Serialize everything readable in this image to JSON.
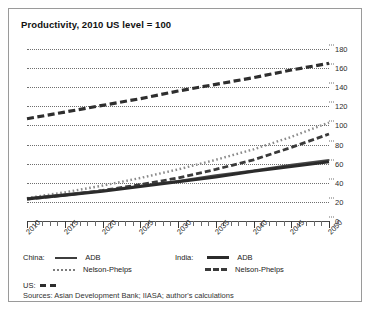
{
  "figure": {
    "title": "Productivity, 2010 US level = 100",
    "sources": "Sources: Asian Development Bank; IIASA; author's calculations"
  },
  "legend": {
    "china_label": "China:",
    "india_label": "India:",
    "us_label": "US:",
    "adb_label": "ADB",
    "nelson_phelps_label": "Nelson-Phelps"
  },
  "chart_data": {
    "type": "line",
    "title": "Productivity, 2010 US level = 100",
    "xlabel": "",
    "ylabel": "",
    "xlim": [
      2010,
      2050
    ],
    "ylim": [
      0,
      180
    ],
    "ytick_values": [
      0,
      20,
      40,
      60,
      80,
      100,
      120,
      140,
      160,
      180
    ],
    "xtick_labels": [
      "2010",
      "2015",
      "2020",
      "2025",
      "2030",
      "2035",
      "2040",
      "2045",
      "2050"
    ],
    "xtick_values": [
      2010,
      2015,
      2020,
      2025,
      2030,
      2035,
      2040,
      2045,
      2050
    ],
    "grid": "horizontal-dotted",
    "legend_position": "below-plot",
    "x": [
      2010,
      2015,
      2020,
      2025,
      2030,
      2035,
      2040,
      2045,
      2050
    ],
    "series": [
      {
        "name": "US",
        "style": "dashed-thick",
        "color": "#2e2e2e",
        "values": [
          107,
          114,
          121,
          128,
          136,
          143,
          150,
          158,
          165
        ]
      },
      {
        "name": "China: Nelson-Phelps",
        "style": "dotted",
        "color": "#8a8a8a",
        "values": [
          24,
          30,
          37,
          45,
          54,
          64,
          75,
          88,
          103
        ]
      },
      {
        "name": "India: Nelson-Phelps",
        "style": "dashed",
        "color": "#3a3a3a",
        "values": [
          23,
          27,
          32,
          38,
          45,
          54,
          64,
          77,
          91
        ]
      },
      {
        "name": "China: ADB",
        "style": "solid-thin",
        "color": "#4a4a4a",
        "values": [
          24,
          28,
          32,
          37,
          42,
          48,
          53,
          59,
          64
        ]
      },
      {
        "name": "India: ADB",
        "style": "solid-thick",
        "color": "#2b2b2b",
        "values": [
          23,
          27,
          31,
          36,
          41,
          46,
          52,
          57,
          62
        ]
      }
    ]
  }
}
